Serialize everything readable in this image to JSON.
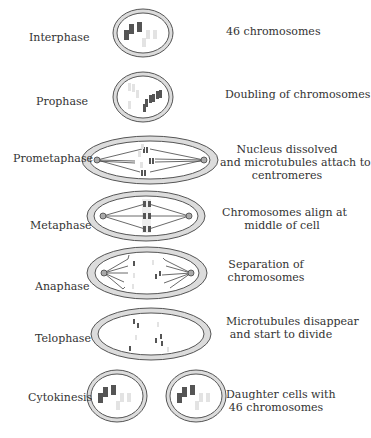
{
  "stages": [
    {
      "label": "Interphase",
      "description": [
        "46 chromosomes"
      ]
    },
    {
      "label": "Prophase",
      "description": [
        "Doubling of chromosomes"
      ]
    },
    {
      "label": "Prometaphase",
      "description": [
        "Nucleus dissolved",
        "and microtubules attach to",
        "centromeres"
      ]
    },
    {
      "label": "Metaphase",
      "description": [
        "Chromosomes align at",
        "middle of  cell"
      ]
    },
    {
      "label": "Anaphase",
      "description": [
        "Separation of",
        "chromosomes"
      ]
    },
    {
      "label": "Telophase",
      "description": [
        "Microtubules disappear",
        "and start to divide"
      ]
    },
    {
      "label": "Cytokinesis",
      "description": [
        "Daughter cells with",
        "46 chromosomes"
      ]
    }
  ],
  "colors": {
    "membrane_fill": "#dcdcdc",
    "outline": "#555555",
    "chromosome_dark": "#555555",
    "chromosome_light": "#e0e0e0"
  }
}
